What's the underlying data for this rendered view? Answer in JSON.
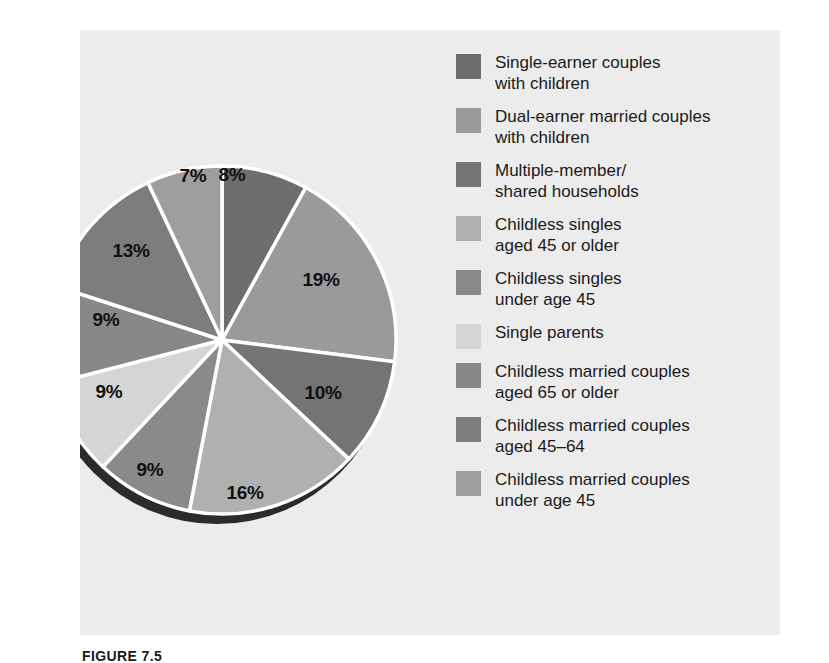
{
  "figure": {
    "caption": "FIGURE 7.5",
    "panel_color": "#ececec",
    "background_color": "#ffffff"
  },
  "chart_data": {
    "type": "pie",
    "title": "",
    "subtitle": "",
    "xlabel": "",
    "ylabel": "",
    "legend_position": "right",
    "start_angle_deg": 0,
    "direction": "clockwise",
    "categories": [
      "Single-earner couples with children",
      "Dual-earner married couples with children",
      "Multiple-member/ shared households",
      "Childless singles aged 45 or older",
      "Childless singles under age 45",
      "Single parents",
      "Childless married couples aged 65 or older",
      "Childless married couples aged 45–64",
      "Childless married couples under age 45"
    ],
    "values": [
      8,
      19,
      10,
      16,
      9,
      9,
      9,
      13,
      7
    ],
    "value_labels": [
      "8%",
      "19%",
      "10%",
      "16%",
      "9%",
      "9%",
      "9%",
      "13%",
      "7%"
    ],
    "colors": [
      "#6e6e6e",
      "#9a9a9a",
      "#747474",
      "#b0b0b0",
      "#8a8a8a",
      "#d5d5d5",
      "#888888",
      "#7d7d7d",
      "#9e9e9e"
    ],
    "slices": [
      {
        "label": "8%",
        "value": 8,
        "color": "#6e6e6e",
        "legend_index": 0,
        "lx": 152,
        "ly": 145
      },
      {
        "label": "19%",
        "value": 19,
        "color": "#9a9a9a",
        "legend_index": 1,
        "ly": 250,
        "lx": 241
      },
      {
        "label": "10%",
        "value": 10,
        "color": "#747474",
        "legend_index": 2,
        "lx": 243,
        "ly": 363
      },
      {
        "label": "16%",
        "value": 16,
        "color": "#b0b0b0",
        "legend_index": 3,
        "lx": 165,
        "ly": 463
      },
      {
        "label": "9%",
        "value": 9,
        "color": "#8a8a8a",
        "legend_index": 4,
        "lx": 70,
        "ly": 440
      },
      {
        "label": "9%",
        "value": 9,
        "color": "#d5d5d5",
        "legend_index": 5,
        "lx": 29,
        "ly": 362
      },
      {
        "label": "9%",
        "value": 9,
        "color": "#888888",
        "legend_index": 6,
        "lx": 26,
        "ly": 290
      },
      {
        "label": "13%",
        "value": 13,
        "color": "#7d7d7d",
        "legend_index": 7,
        "lx": 51,
        "ly": 221
      },
      {
        "label": "7%",
        "value": 7,
        "color": "#9e9e9e",
        "legend_index": 8,
        "lx": 113,
        "ly": 146
      }
    ]
  },
  "legend": {
    "items": [
      {
        "label": "Single-earner couples\nwith children",
        "color": "#6e6e6e"
      },
      {
        "label": "Dual-earner married couples\nwith children",
        "color": "#9a9a9a"
      },
      {
        "label": "Multiple-member/\nshared households",
        "color": "#747474"
      },
      {
        "label": "Childless singles\naged 45 or older",
        "color": "#b0b0b0"
      },
      {
        "label": "Childless singles\nunder age 45",
        "color": "#8a8a8a"
      },
      {
        "label": "Single parents",
        "color": "#d5d5d5"
      },
      {
        "label": "Childless married couples\naged 65 or older",
        "color": "#888888"
      },
      {
        "label": "Childless married couples\naged 45–64",
        "color": "#7d7d7d"
      },
      {
        "label": "Childless married couples\nunder age 45",
        "color": "#9e9e9e"
      }
    ]
  }
}
